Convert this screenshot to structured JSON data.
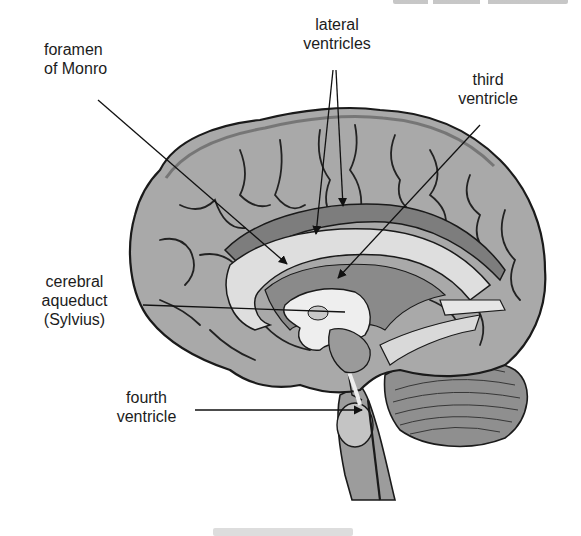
{
  "figure": {
    "labels": {
      "foramen_monro": "foramen\nof Monro",
      "lateral_ventricles": "lateral\nventricles",
      "third_ventricle": "third\nventricle",
      "cerebral_aqueduct": "cerebral\naqueduct\n(Sylvius)",
      "fourth_ventricle": "fourth\nventricle"
    },
    "colors": {
      "cortex": "#a9a9a9",
      "cortex_dark": "#7a7a7a",
      "ventricle": "#e2e2e2",
      "corpus_callosum": "#d0d0d0",
      "outline": "#1a1a1a",
      "background": "#ffffff"
    }
  }
}
